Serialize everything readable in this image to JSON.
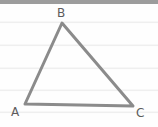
{
  "figure": {
    "kind": "geometry-diagram",
    "shape": "triangle",
    "background_color": "#fefefe",
    "width": 158,
    "height": 127
  },
  "paper": {
    "top_bar": {
      "color": "#9c9c9c",
      "y": 0,
      "height": 4
    },
    "rule_color": "#efefef",
    "rule_positions": [
      22,
      45,
      68,
      90,
      112
    ]
  },
  "triangle": {
    "stroke_color": "#8b8b8b",
    "stroke_width": 3,
    "fill": "none",
    "points": "25,104 62,23 133,106",
    "vertices": [
      {
        "label": "A",
        "x": 25,
        "y": 104
      },
      {
        "label": "B",
        "x": 62,
        "y": 23
      },
      {
        "label": "C",
        "x": 133,
        "y": 106
      }
    ]
  },
  "labels": {
    "a": "A",
    "b": "B",
    "c": "C",
    "color": "#5c5c5c"
  }
}
